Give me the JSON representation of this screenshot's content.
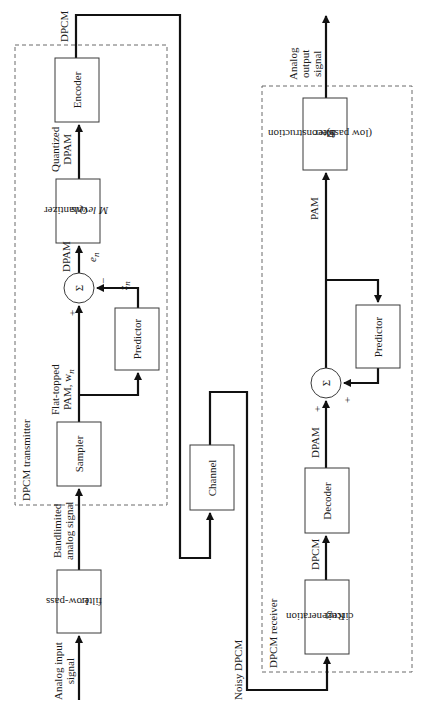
{
  "transmitter": {
    "group_label": "DPCM transmitter",
    "blocks": {
      "encoder": "Encoder",
      "quantizer_line1": "Quantizer",
      "quantizer_line2": "M levels",
      "predictor": "Predictor",
      "sampler": "Sampler",
      "summer": "Σ"
    },
    "signals": {
      "output": "DPCM",
      "quantized_line1": "Quantized",
      "quantized_line2": "DPAM",
      "dpam": "DPAM",
      "error": "e",
      "error_sub": "n",
      "prediction": "z",
      "prediction_sub": "n",
      "minus": "−",
      "plus": "+",
      "flat_line1": "Flat-topped",
      "flat_line2": "PAM, w",
      "flat_sub": "n"
    }
  },
  "front_end": {
    "lowpass_line1": "Low-pass",
    "lowpass_line2": "filter",
    "input_line1": "Analog input",
    "input_line2": "signal",
    "bandlimited_line1": "Bandlimited",
    "bandlimited_line2": "analog signal"
  },
  "channel": {
    "label": "Channel",
    "noisy": "Noisy DPCM"
  },
  "receiver": {
    "group_label": "DPCM receiver",
    "blocks": {
      "regen_line1": "Regeneration",
      "regen_line2": "circuit",
      "decoder": "Decoder",
      "predictor": "Predictor",
      "summer": "Σ",
      "recon_line1": "Reconstruction",
      "recon_line2": "filter",
      "recon_line3": "(low pass)"
    },
    "signals": {
      "dpcm": "DPCM",
      "dpam": "DPAM",
      "plus1": "+",
      "plus2": "+",
      "pam": "PAM",
      "output_line1": "Analog",
      "output_line2": "output",
      "output_line3": "signal"
    }
  }
}
